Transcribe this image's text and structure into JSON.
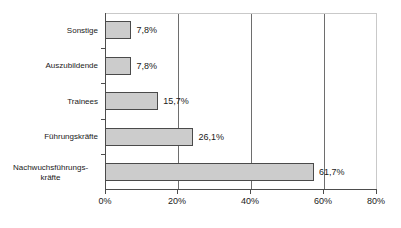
{
  "chart_data": {
    "type": "bar",
    "orientation": "horizontal",
    "title": "",
    "subtitle": "",
    "xlabel": "",
    "ylabel": "",
    "categories": [
      "Sonstige",
      "Auszubildende",
      "Trainees",
      "Führungskräfte",
      "Nachwuchsführungs-\nkräfte"
    ],
    "values": [
      7.8,
      7.8,
      15.7,
      26.1,
      61.7
    ],
    "value_labels": [
      "7,8%",
      "7,8%",
      "15,7%",
      "26,1%",
      "61,7%"
    ],
    "xlim": [
      0,
      80
    ],
    "x_ticks": [
      0,
      20,
      40,
      60,
      80
    ],
    "x_tick_labels": [
      "0%",
      "20%",
      "40%",
      "60%",
      "80%"
    ],
    "grid": "vertical",
    "legend": null,
    "series": [
      {
        "name": "",
        "values": [
          7.8,
          7.8,
          15.7,
          26.1,
          61.7
        ]
      }
    ],
    "colors": {
      "bar_fill": "#cccccc",
      "bar_border": "#4a4a4a",
      "gridline": "#6e6e6e",
      "axis": "#4d4d4d",
      "text": "#1a1a1a",
      "background": "#ffffff"
    }
  }
}
